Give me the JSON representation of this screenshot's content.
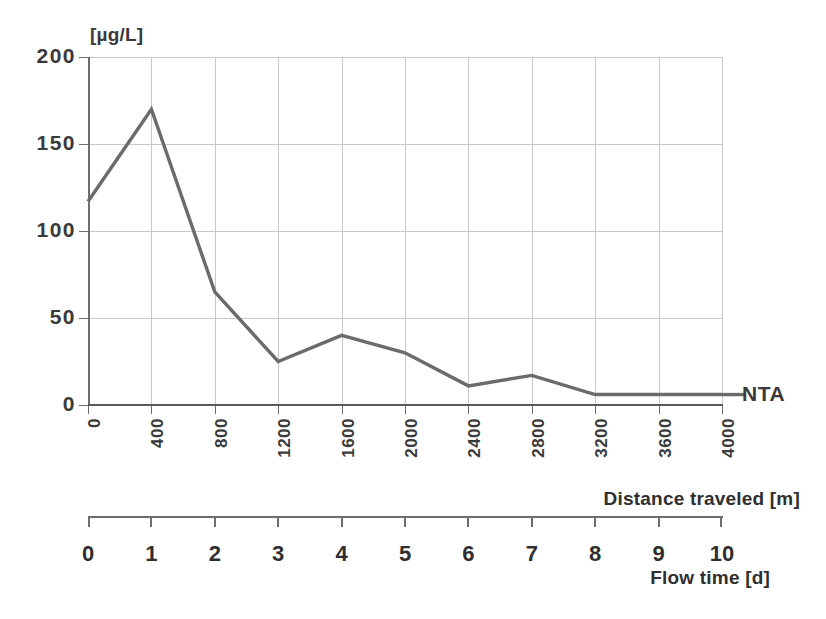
{
  "chart_data": {
    "type": "line",
    "title": "",
    "subtitle": "",
    "xlabel": "Distance traveled [m]",
    "ylabel": "[µg/L]",
    "secondary_xlabel": "Flow time [d]",
    "grid": true,
    "legend_position": "right-inline",
    "xlim": [
      0,
      4000
    ],
    "ylim": [
      0,
      200
    ],
    "yticks": [
      0,
      50,
      100,
      150,
      200
    ],
    "xticks": [
      0,
      400,
      800,
      1200,
      1600,
      2000,
      2400,
      2800,
      3200,
      3600,
      4000
    ],
    "secondary_xticks": [
      0,
      1,
      2,
      3,
      4,
      5,
      6,
      7,
      8,
      9,
      10
    ],
    "x": [
      0,
      400,
      800,
      1200,
      1600,
      2000,
      2400,
      2800,
      3200,
      3600,
      4000
    ],
    "series": [
      {
        "name": "NTA",
        "values": [
          117,
          170,
          65,
          25,
          40,
          30,
          11,
          17,
          6,
          6,
          6
        ],
        "color": "#6b6b6b"
      }
    ]
  },
  "axes": {
    "y_unit_label": "[µg/L]",
    "y_tick_labels": [
      "200",
      "150",
      "100",
      "50",
      "0"
    ],
    "x_tick_labels": [
      "0",
      "400",
      "800",
      "1200",
      "1600",
      "2000",
      "2400",
      "2800",
      "3200",
      "3600",
      "4000"
    ],
    "distance_axis_title": "Distance traveled [m]",
    "flow_tick_labels": [
      "0",
      "1",
      "2",
      "3",
      "4",
      "5",
      "6",
      "7",
      "8",
      "9",
      "10"
    ],
    "flow_axis_title": "Flow time [d]"
  },
  "legend": {
    "series_label": "NTA"
  },
  "colors": {
    "line": "#6b6b6b",
    "grid": "#c9c9c9",
    "axis": "#6e6e6e",
    "text": "#3a3a3a",
    "background": "#ffffff"
  }
}
